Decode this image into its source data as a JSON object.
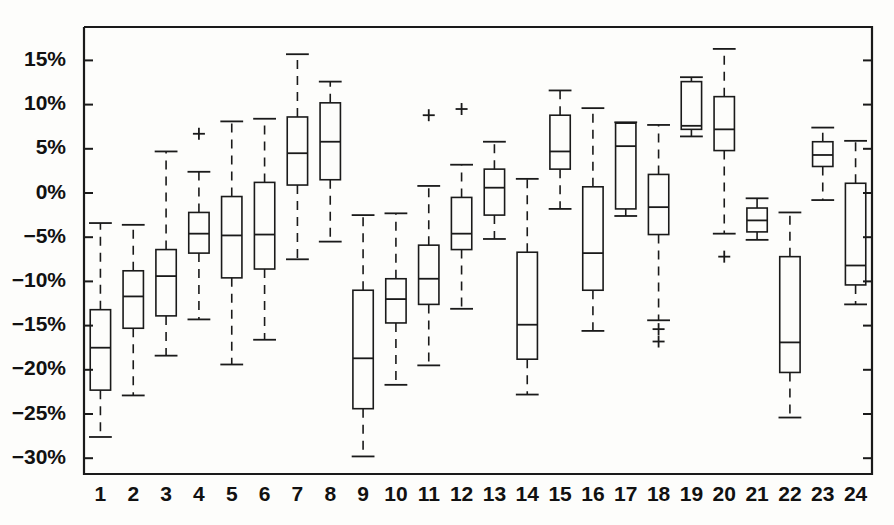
{
  "chart_data": {
    "type": "boxplot",
    "title": "",
    "subtitle": "",
    "xlabel": "",
    "ylabel": "",
    "grid": false,
    "legend": null,
    "ylim": [
      -32.5,
      18.5
    ],
    "ytick_values": [
      15,
      10,
      5,
      0,
      -5,
      -10,
      -15,
      -20,
      -25,
      -30
    ],
    "ytick_labels": [
      "15%",
      "10%",
      "5%",
      "0%",
      "−5%",
      "−10%",
      "−15%",
      "−20%",
      "−25%",
      "−30%"
    ],
    "categories": [
      "1",
      "2",
      "3",
      "4",
      "5",
      "6",
      "7",
      "8",
      "9",
      "10",
      "11",
      "12",
      "13",
      "14",
      "15",
      "16",
      "17",
      "18",
      "19",
      "20",
      "21",
      "22",
      "23",
      "24"
    ],
    "unit": "%",
    "boxes": [
      {
        "label": "1",
        "whisker_low": -27.6,
        "q1": -22.3,
        "median": -17.5,
        "q3": -13.2,
        "whisker_high": -3.4,
        "outliers": []
      },
      {
        "label": "2",
        "whisker_low": -22.9,
        "q1": -15.3,
        "median": -11.7,
        "q3": -8.8,
        "whisker_high": -3.6,
        "outliers": []
      },
      {
        "label": "3",
        "whisker_low": -18.4,
        "q1": -13.9,
        "median": -9.4,
        "q3": -6.4,
        "whisker_high": 4.7,
        "outliers": []
      },
      {
        "label": "4",
        "whisker_low": -14.3,
        "q1": -6.8,
        "median": -4.6,
        "q3": -2.2,
        "whisker_high": 2.4,
        "outliers": [
          6.7
        ]
      },
      {
        "label": "5",
        "whisker_low": -19.4,
        "q1": -9.6,
        "median": -4.8,
        "q3": -0.4,
        "whisker_high": 8.1,
        "outliers": []
      },
      {
        "label": "6",
        "whisker_low": -16.6,
        "q1": -8.6,
        "median": -4.7,
        "q3": 1.2,
        "whisker_high": 8.4,
        "outliers": []
      },
      {
        "label": "7",
        "whisker_low": -7.5,
        "q1": 0.9,
        "median": 4.5,
        "q3": 8.6,
        "whisker_high": 15.7,
        "outliers": []
      },
      {
        "label": "8",
        "whisker_low": -5.5,
        "q1": 1.5,
        "median": 5.8,
        "q3": 10.2,
        "whisker_high": 12.6,
        "outliers": []
      },
      {
        "label": "9",
        "whisker_low": -29.8,
        "q1": -24.4,
        "median": -18.7,
        "q3": -11.0,
        "whisker_high": -2.5,
        "outliers": []
      },
      {
        "label": "10",
        "whisker_low": -21.7,
        "q1": -14.7,
        "median": -12.0,
        "q3": -9.7,
        "whisker_high": -2.3,
        "outliers": []
      },
      {
        "label": "11",
        "whisker_low": -19.5,
        "q1": -12.6,
        "median": -9.7,
        "q3": -5.9,
        "whisker_high": 0.8,
        "outliers": [
          8.8
        ]
      },
      {
        "label": "12",
        "whisker_low": -13.1,
        "q1": -6.4,
        "median": -4.6,
        "q3": -0.5,
        "whisker_high": 3.2,
        "outliers": [
          9.5
        ]
      },
      {
        "label": "13",
        "whisker_low": -5.2,
        "q1": -2.5,
        "median": 0.6,
        "q3": 2.7,
        "whisker_high": 5.8,
        "outliers": []
      },
      {
        "label": "14",
        "whisker_low": -22.8,
        "q1": -18.8,
        "median": -14.9,
        "q3": -6.7,
        "whisker_high": 1.6,
        "outliers": []
      },
      {
        "label": "15",
        "whisker_low": -1.8,
        "q1": 2.7,
        "median": 4.7,
        "q3": 8.8,
        "whisker_high": 11.6,
        "outliers": []
      },
      {
        "label": "16",
        "whisker_low": -15.6,
        "q1": -11.0,
        "median": -6.8,
        "q3": 0.7,
        "whisker_high": 9.6,
        "outliers": []
      },
      {
        "label": "17",
        "whisker_low": -2.6,
        "q1": -1.8,
        "median": 5.3,
        "q3": 7.9,
        "whisker_high": 8.0,
        "outliers": []
      },
      {
        "label": "18",
        "whisker_low": -14.4,
        "q1": -4.7,
        "median": -1.6,
        "q3": 2.1,
        "whisker_high": 7.7,
        "outliers": [
          -15.4,
          -16.8
        ]
      },
      {
        "label": "19",
        "whisker_low": 6.4,
        "q1": 7.2,
        "median": 7.6,
        "q3": 12.6,
        "whisker_high": 13.1,
        "outliers": []
      },
      {
        "label": "20",
        "whisker_low": -4.6,
        "q1": 4.8,
        "median": 7.2,
        "q3": 10.9,
        "whisker_high": 16.3,
        "outliers": [
          -7.2
        ]
      },
      {
        "label": "21",
        "whisker_low": -5.3,
        "q1": -4.4,
        "median": -3.1,
        "q3": -1.7,
        "whisker_high": -0.6,
        "outliers": []
      },
      {
        "label": "22",
        "whisker_low": -25.4,
        "q1": -20.3,
        "median": -16.9,
        "q3": -7.2,
        "whisker_high": -2.2,
        "outliers": []
      },
      {
        "label": "23",
        "whisker_low": -0.8,
        "q1": 3.0,
        "median": 4.3,
        "q3": 5.8,
        "whisker_high": 7.4,
        "outliers": []
      },
      {
        "label": "24",
        "whisker_low": -12.6,
        "q1": -10.4,
        "median": -8.2,
        "q3": 1.1,
        "whisker_high": 5.9,
        "outliers": []
      }
    ]
  },
  "axes": {
    "y_axis_name": "percent-return-axis",
    "x_axis_name": "group-index-axis"
  },
  "colors": {
    "line": "#1a1a1a",
    "background": "#fdfdfb",
    "box_fill": "none"
  }
}
